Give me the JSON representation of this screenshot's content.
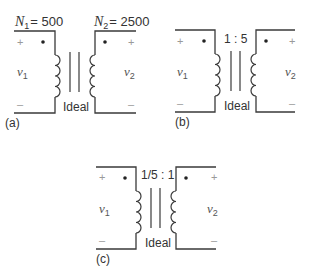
{
  "figure": {
    "panels": [
      {
        "caption": "(a)",
        "primary_label": {
          "symbol": "N",
          "sub": "1",
          "value": "= 500"
        },
        "secondary_label": {
          "symbol": "N",
          "sub": "2",
          "value": "= 2500"
        },
        "ratio": "",
        "core_label": "Ideal",
        "v1": {
          "symbol": "v",
          "sub": "1"
        },
        "v2": {
          "symbol": "v",
          "sub": "2"
        },
        "plus": "+",
        "minus": "–"
      },
      {
        "caption": "(b)",
        "ratio": "1 : 5",
        "core_label": "Ideal",
        "v1": {
          "symbol": "v",
          "sub": "1"
        },
        "v2": {
          "symbol": "v",
          "sub": "2"
        },
        "plus": "+",
        "minus": "–"
      },
      {
        "caption": "(c)",
        "ratio": "1/5 : 1",
        "core_label": "Ideal",
        "v1": {
          "symbol": "v",
          "sub": "1"
        },
        "v2": {
          "symbol": "v",
          "sub": "2"
        },
        "plus": "+",
        "minus": "–"
      }
    ],
    "colors": {
      "line": "#3a3a3a",
      "dot": "#222222",
      "polarity": "#9a9a9a"
    }
  }
}
